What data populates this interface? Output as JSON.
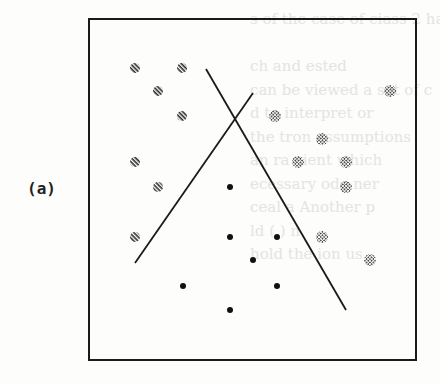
{
  "figure": {
    "panel_label": "(a)",
    "frame": {
      "x": 89,
      "y": 19,
      "width": 327,
      "height": 341
    },
    "colors": {
      "ink": "#1a1a1a",
      "hatch": "#2a2a2a",
      "dotted": "#3a3a3a",
      "dot": "#111111"
    }
  },
  "chart_data": {
    "type": "scatter",
    "title": "(a)",
    "xlabel": "",
    "ylabel": "",
    "grid": false,
    "legend": "none",
    "coordinate_note": "pixel coordinates within screenshot; y increases downward",
    "series": [
      {
        "name": "class-hatched",
        "marker": "diagonal-hatch",
        "points": [
          [
            135,
            68
          ],
          [
            182,
            68
          ],
          [
            158,
            91
          ],
          [
            182,
            116
          ],
          [
            135,
            162
          ],
          [
            158,
            187
          ],
          [
            135,
            237
          ]
        ]
      },
      {
        "name": "class-dotted",
        "marker": "crosshatch-dot",
        "points": [
          [
            390,
            91
          ],
          [
            275,
            116
          ],
          [
            322,
            139
          ],
          [
            298,
            162
          ],
          [
            346,
            162
          ],
          [
            346,
            187
          ],
          [
            322,
            237
          ],
          [
            370,
            260
          ]
        ]
      },
      {
        "name": "class-solid",
        "marker": "filled-circle",
        "points": [
          [
            230,
            187
          ],
          [
            230,
            237
          ],
          [
            277,
            237
          ],
          [
            253,
            260
          ],
          [
            183,
            286
          ],
          [
            277,
            286
          ],
          [
            230,
            310
          ]
        ]
      }
    ],
    "lines": [
      {
        "name": "decision-boundary-1",
        "from": [
          206,
          69
        ],
        "to": [
          346,
          310
        ]
      },
      {
        "name": "decision-boundary-2",
        "from": [
          253,
          93
        ],
        "to": [
          135,
          263
        ]
      }
    ]
  },
  "background_bleed_text": [
    "s of the case of ciass 2 have pla",
    "        ",
    "ch        and  ested",
    "can be viewed    a set of c",
    "d           to  interpret  or",
    "the        tron  assumptions",
    "an  ra          cient  which",
    "ecessary        ode  ner     ",
    "ceal  a       Another  p",
    "ld  (     )   n",
    "hold the          ion  us",
    "                            "
  ]
}
